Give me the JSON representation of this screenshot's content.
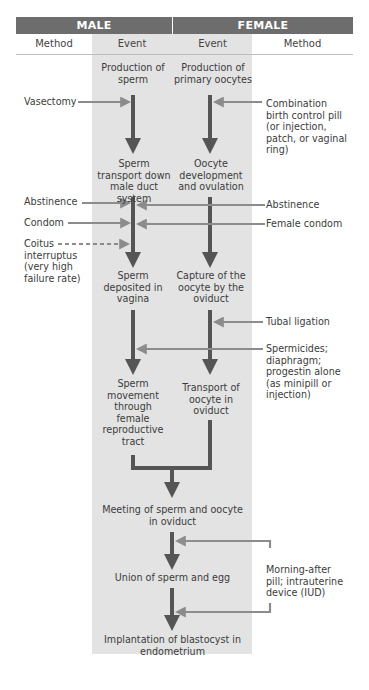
{
  "header": {
    "male": "MALE",
    "female": "FEMALE",
    "columns": [
      "Method",
      "Event",
      "Event",
      "Method"
    ]
  },
  "male_events": [
    "Production of sperm",
    "Sperm transport down male duct system",
    "Sperm deposited in vagina",
    "Sperm movement through female reproductive tract"
  ],
  "female_events": [
    "Production of primary oocytes",
    "Oocyte development and ovulation",
    "Capture of the oocyte by the oviduct",
    "Transport of oocyte in oviduct"
  ],
  "shared_events": [
    "Meeting of sperm and oocyte in oviduct",
    "Union of sperm and egg",
    "Implantation of blastocyst in endometrium"
  ],
  "male_methods": [
    {
      "label": "Vasectomy",
      "style": "solid"
    },
    {
      "label": "Abstinence",
      "style": "solid"
    },
    {
      "label": "Condom",
      "style": "solid"
    },
    {
      "label": "Coitus interruptus (very high failure rate)",
      "style": "dashed"
    }
  ],
  "female_methods": [
    {
      "label": "Combination birth control pill (or injection, patch, or vaginal ring)"
    },
    {
      "label": "Abstinence"
    },
    {
      "label": "Female condom"
    },
    {
      "label": "Tubal ligation"
    },
    {
      "label": "Spermicides; diaphragm; progestin alone (as minipill or injection)"
    },
    {
      "label": "Morning-after pill; intrauterine device (IUD)"
    }
  ],
  "colors": {
    "header_bg": "#6d6d6d",
    "event_band": "#e3e3e3",
    "main_arrow": "#555555",
    "method_arrow": "#8c8c8c"
  }
}
